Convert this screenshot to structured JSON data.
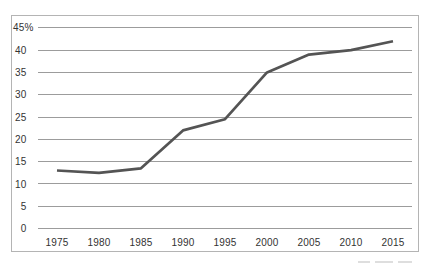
{
  "chart_data": {
    "type": "line",
    "title": "",
    "xlabel": "",
    "ylabel": "",
    "unit": "%",
    "categories": [
      "1975",
      "1980",
      "1985",
      "1990",
      "1995",
      "2000",
      "2005",
      "2010",
      "2015"
    ],
    "values": [
      13,
      12.5,
      13.5,
      22,
      24.5,
      35,
      39,
      40,
      42
    ],
    "ylim": [
      0,
      45
    ],
    "y_step": 5,
    "y_tick_labels": [
      "0",
      "5",
      "10",
      "15",
      "20",
      "25",
      "30",
      "35",
      "40",
      "45%"
    ],
    "grid": "horizontal-only",
    "legend": "none",
    "colors": {
      "line": "#545454",
      "gridline": "#9c9c9c",
      "frame_border": "#b4b4b4",
      "tick_text": "#333333",
      "background": "#ffffff"
    }
  }
}
